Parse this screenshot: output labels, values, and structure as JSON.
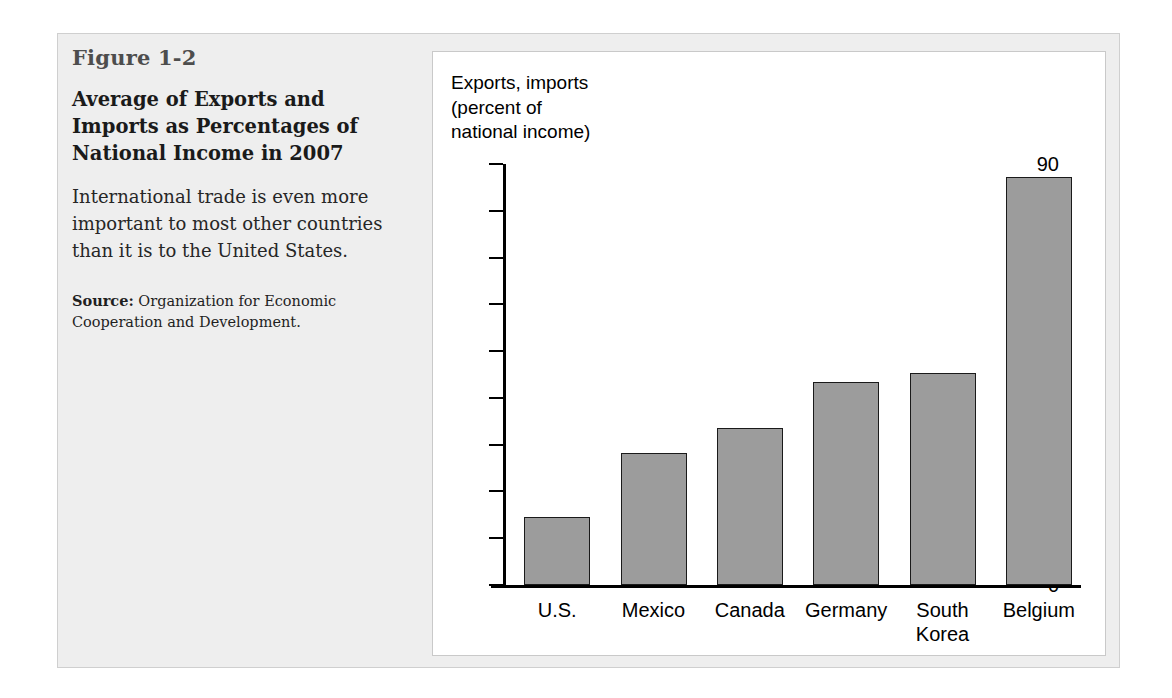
{
  "figure": {
    "number": "Figure 1-2",
    "title": "Average of Exports and Imports as Percentages of National Income in 2007",
    "description": "International trade is even more important to most other countries than it is to the United States.",
    "source_label": "Source:",
    "source_text": " Organization for Economic Cooperation and Development."
  },
  "colors": {
    "bar_fill": "#9c9c9c",
    "bar_stroke": "#1a1a1a",
    "panel_background": "#eeeeee",
    "chart_background": "#ffffff",
    "axis": "#000000"
  },
  "chart_data": {
    "type": "bar",
    "title": "Average of Exports and Imports as Percentages of National Income in 2007",
    "axis_caption": "Exports, imports\n(percent of\nnational income)",
    "categories": [
      "U.S.",
      "Mexico",
      "Canada",
      "Germany",
      "South\nKorea",
      "Belgium"
    ],
    "values": [
      14.5,
      28.3,
      33.5,
      43.5,
      45.3,
      87.3
    ],
    "xlabel": "",
    "ylabel": "Exports, imports (percent of national income)",
    "ylim": [
      0,
      90
    ],
    "ytick_labels": [
      "90",
      "80",
      "70",
      "60",
      "50",
      "40",
      "30",
      "20",
      "10",
      "0"
    ],
    "ytick_values": [
      90,
      80,
      70,
      60,
      50,
      40,
      30,
      20,
      10,
      0
    ],
    "ytick_step": 10,
    "grid": false,
    "legend": false
  }
}
